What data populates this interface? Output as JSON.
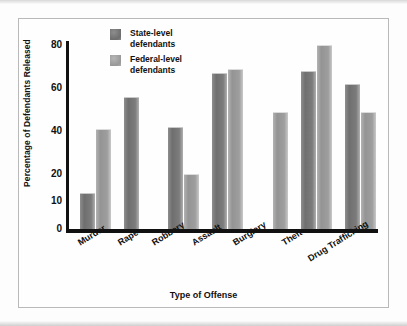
{
  "chart_data": {
    "type": "bar",
    "title": "",
    "xlabel": "Type of Offense",
    "ylabel": "Percentage of Defendants Released",
    "categories": [
      "Murder",
      "Rape",
      "Robbery",
      "Assault",
      "Burglary",
      "Theft",
      "Drug Trafficking"
    ],
    "series": [
      {
        "name": "State-level defendants",
        "color": "#7c7c7c",
        "values": [
          13,
          56,
          42,
          67,
          null,
          68,
          62
        ]
      },
      {
        "name": "Federal-level defendants",
        "color": "#9e9e9e",
        "values": [
          41,
          null,
          20,
          69,
          49,
          80,
          49
        ]
      }
    ],
    "ylim": [
      0,
      80
    ],
    "yticks": [
      0,
      10,
      20,
      40,
      60,
      80
    ],
    "ytick_labels": [
      "0",
      "10",
      "20",
      "40",
      "60",
      "80"
    ],
    "grid": false,
    "legend_position": "top-left-inside"
  },
  "legend": {
    "items": [
      {
        "label_line1": "State-level",
        "label_line2": "defendants",
        "swatch": "state-swatch"
      },
      {
        "label_line1": "Federal-level",
        "label_line2": "defendants",
        "swatch": "federal-swatch"
      }
    ]
  }
}
